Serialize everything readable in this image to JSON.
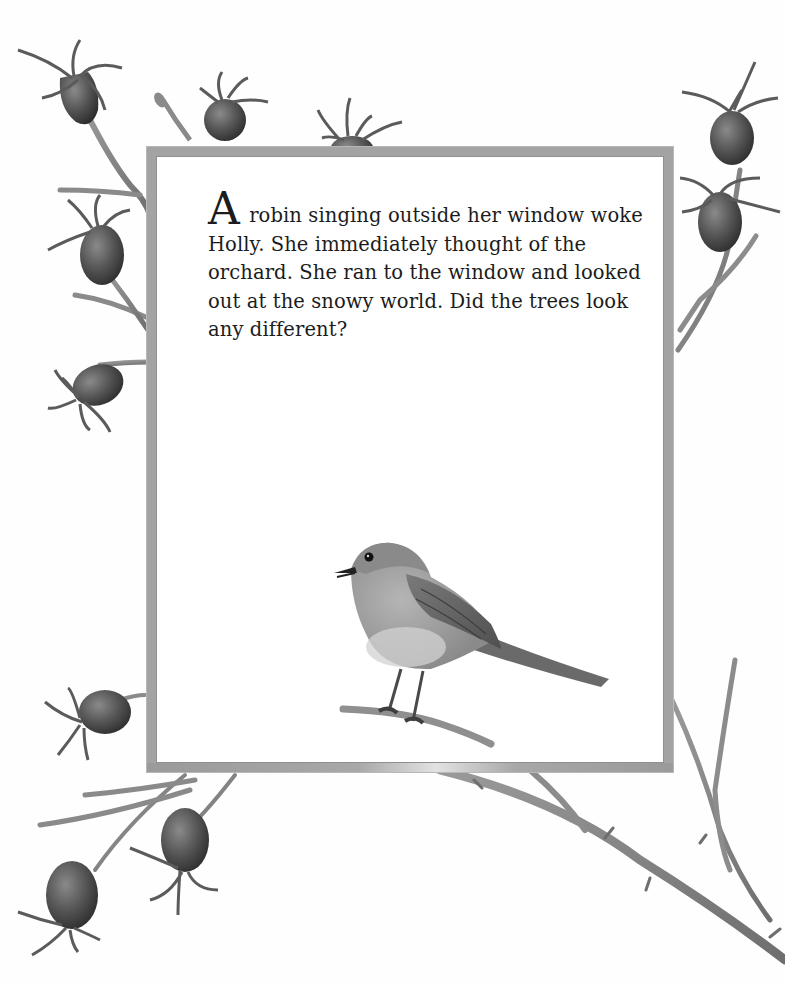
{
  "page": {
    "story": {
      "drop_cap": "A",
      "text": " robin singing outside her window woke Holly.  She immediately thought of the orchard.  She ran to the window and looked out at the snowy world.  Did the trees look any different?"
    },
    "illustrations": {
      "center": "robin-perched-on-twig",
      "border": "rosehip-branches"
    },
    "colors": {
      "frame_border": "#a3a3a3",
      "ink": "#1c1c1c",
      "rosehip": "#5a5a5a",
      "branch": "#8c8c8c",
      "paper": "#ffffff"
    }
  }
}
